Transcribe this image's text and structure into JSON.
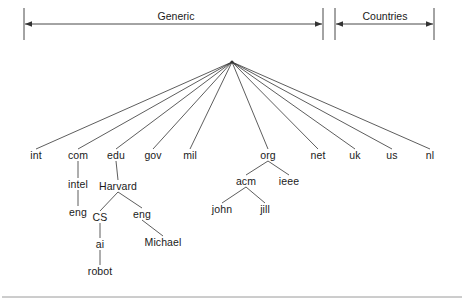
{
  "figure": {
    "type": "tree-diagram",
    "background_color": "#ffffff",
    "line_color": "#333333",
    "text_color": "#1a1a1a"
  },
  "brackets": [
    {
      "label": "Generic",
      "label_x": 176,
      "label_y": 16,
      "x_start": 24,
      "x_end": 323,
      "y": 24,
      "tick_top": 8,
      "tick_bottom": 40
    },
    {
      "label": "Countries",
      "label_x": 385,
      "label_y": 16,
      "x_start": 335,
      "x_end": 434,
      "y": 24,
      "tick_top": 8,
      "tick_bottom": 40
    }
  ],
  "root": {
    "name": "root",
    "x": 232,
    "y": 62
  },
  "nodes": [
    {
      "id": "int",
      "label": "int",
      "x": 36,
      "y": 155
    },
    {
      "id": "com",
      "label": "com",
      "x": 78,
      "y": 155
    },
    {
      "id": "edu",
      "label": "edu",
      "x": 116,
      "y": 155
    },
    {
      "id": "gov",
      "label": "gov",
      "x": 153,
      "y": 155
    },
    {
      "id": "mil",
      "label": "mil",
      "x": 190,
      "y": 155
    },
    {
      "id": "org",
      "label": "org",
      "x": 268,
      "y": 155
    },
    {
      "id": "net",
      "label": "net",
      "x": 318,
      "y": 155
    },
    {
      "id": "uk",
      "label": "uk",
      "x": 355,
      "y": 155
    },
    {
      "id": "us",
      "label": "us",
      "x": 392,
      "y": 155
    },
    {
      "id": "nl",
      "label": "nl",
      "x": 430,
      "y": 155
    },
    {
      "id": "intel",
      "label": "intel",
      "x": 78,
      "y": 184
    },
    {
      "id": "eng1",
      "label": "eng",
      "x": 78,
      "y": 212
    },
    {
      "id": "Harvard",
      "label": "Harvard",
      "x": 118,
      "y": 186
    },
    {
      "id": "CS",
      "label": "CS",
      "x": 100,
      "y": 217
    },
    {
      "id": "eng2",
      "label": "eng",
      "x": 142,
      "y": 214
    },
    {
      "id": "ai",
      "label": "ai",
      "x": 100,
      "y": 244
    },
    {
      "id": "robot",
      "label": "robot",
      "x": 100,
      "y": 271
    },
    {
      "id": "Michael",
      "label": "Michael",
      "x": 163,
      "y": 242
    },
    {
      "id": "acm",
      "label": "acm",
      "x": 246,
      "y": 181
    },
    {
      "id": "ieee",
      "label": "ieee",
      "x": 289,
      "y": 181
    },
    {
      "id": "john",
      "label": "john",
      "x": 222,
      "y": 209
    },
    {
      "id": "jill",
      "label": "jill",
      "x": 265,
      "y": 209
    }
  ],
  "edges": [
    {
      "from": "root",
      "to": "int"
    },
    {
      "from": "root",
      "to": "com"
    },
    {
      "from": "root",
      "to": "edu"
    },
    {
      "from": "root",
      "to": "gov"
    },
    {
      "from": "root",
      "to": "mil"
    },
    {
      "from": "root",
      "to": "org"
    },
    {
      "from": "root",
      "to": "net"
    },
    {
      "from": "root",
      "to": "uk"
    },
    {
      "from": "root",
      "to": "us"
    },
    {
      "from": "root",
      "to": "nl"
    },
    {
      "from": "com",
      "to": "intel"
    },
    {
      "from": "intel",
      "to": "eng1"
    },
    {
      "from": "edu",
      "to": "Harvard"
    },
    {
      "from": "Harvard",
      "to": "CS"
    },
    {
      "from": "Harvard",
      "to": "eng2"
    },
    {
      "from": "CS",
      "to": "ai"
    },
    {
      "from": "ai",
      "to": "robot"
    },
    {
      "from": "eng2",
      "to": "Michael"
    },
    {
      "from": "org",
      "to": "acm"
    },
    {
      "from": "org",
      "to": "ieee"
    },
    {
      "from": "acm",
      "to": "john"
    },
    {
      "from": "acm",
      "to": "jill"
    }
  ],
  "footer_rule": {
    "y": 297,
    "x_start": 2,
    "x_end": 462
  }
}
